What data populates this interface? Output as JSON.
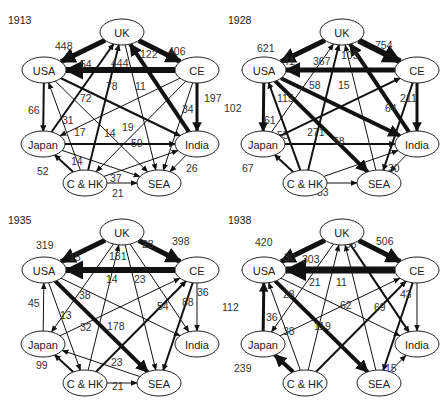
{
  "nodes": {
    "UK": {
      "label": "UK",
      "x": 122,
      "y": 32
    },
    "USA": {
      "label": "USA",
      "x": 44,
      "y": 70
    },
    "CE": {
      "label": "CE",
      "x": 197,
      "y": 70
    },
    "Japan": {
      "label": "Japan",
      "x": 43,
      "y": 144
    },
    "India": {
      "label": "India",
      "x": 197,
      "y": 144
    },
    "CHK": {
      "label": "C & HK",
      "x": 85,
      "y": 183
    },
    "SEA": {
      "label": "SEA",
      "x": 159,
      "y": 183
    }
  },
  "panels": [
    {
      "year": "1913",
      "ox": 0,
      "oy": 0,
      "edges": [
        {
          "from": "UK",
          "to": "USA",
          "value": "448",
          "w": 5,
          "lx": 55,
          "ly": 50
        },
        {
          "from": "UK",
          "to": "CE",
          "value": "406",
          "w": 5,
          "lx": 168,
          "ly": 55
        },
        {
          "from": "CE",
          "to": "USA",
          "value": "444",
          "w": 6,
          "lx": 111,
          "ly": 67
        },
        {
          "from": "India",
          "to": "UK",
          "value": "122",
          "w": 4,
          "lx": 140,
          "ly": 58
        },
        {
          "from": "CE",
          "to": "India",
          "value": "197",
          "w": 3,
          "lx": 204,
          "ly": 102
        },
        {
          "from": "Japan",
          "to": "UK",
          "value": "54",
          "w": 2,
          "lx": 80,
          "ly": 68
        },
        {
          "from": "CHK",
          "to": "UK",
          "value": "78",
          "w": 2,
          "lx": 106,
          "ly": 90
        },
        {
          "from": "UK",
          "to": "SEA",
          "value": "11",
          "w": 1,
          "lx": 135,
          "ly": 90
        },
        {
          "from": "USA",
          "to": "India",
          "value": "72",
          "w": 2,
          "lx": 80,
          "ly": 102
        },
        {
          "from": "CE",
          "to": "SEA",
          "value": "34",
          "w": 1,
          "lx": 182,
          "ly": 113
        },
        {
          "from": "USA",
          "to": "Japan",
          "value": "66",
          "w": 2,
          "lx": 28,
          "ly": 114
        },
        {
          "from": "CHK",
          "to": "USA",
          "value": "31",
          "w": 1,
          "lx": 62,
          "ly": 124
        },
        {
          "from": "CE",
          "to": "Japan",
          "value": "17",
          "w": 1,
          "lx": 74,
          "ly": 136
        },
        {
          "from": "USA",
          "to": "SEA",
          "value": "14",
          "w": 1,
          "lx": 104,
          "ly": 137
        },
        {
          "from": "CE",
          "to": "CHK",
          "value": "19",
          "w": 1,
          "lx": 122,
          "ly": 131
        },
        {
          "from": "Japan",
          "to": "India",
          "value": "59",
          "w": 2,
          "lx": 131,
          "ly": 147
        },
        {
          "from": "Japan",
          "to": "SEA",
          "value": "14",
          "w": 1,
          "lx": 71,
          "ly": 165
        },
        {
          "from": "CHK",
          "to": "Japan",
          "value": "52",
          "w": 2,
          "lx": 37,
          "ly": 175
        },
        {
          "from": "CHK",
          "to": "India",
          "value": "37",
          "w": 1,
          "lx": 110,
          "ly": 182
        },
        {
          "from": "CHK",
          "to": "SEA",
          "value": "21",
          "w": 1,
          "lx": 112,
          "ly": 197
        },
        {
          "from": "India",
          "to": "SEA",
          "value": "26",
          "w": 1,
          "lx": 186,
          "ly": 172
        }
      ]
    },
    {
      "year": "1928",
      "ox": 220,
      "oy": 0,
      "edges": [
        {
          "from": "UK",
          "to": "USA",
          "value": "621",
          "w": 5,
          "lx": 37,
          "ly": 52
        },
        {
          "from": "UK",
          "to": "CE",
          "value": "754",
          "w": 6,
          "lx": 155,
          "ly": 49
        },
        {
          "from": "CE",
          "to": "USA",
          "value": "367",
          "w": 5,
          "lx": 93,
          "ly": 65
        },
        {
          "from": "India",
          "to": "UK",
          "value": "105",
          "w": 4,
          "lx": 121,
          "ly": 59
        },
        {
          "from": "Japan",
          "to": "UK",
          "value": "41",
          "w": 1,
          "lx": 63,
          "ly": 65
        },
        {
          "from": "CHK",
          "to": "UK",
          "value": "58",
          "w": 2,
          "lx": 89,
          "ly": 89
        },
        {
          "from": "SEA",
          "to": "UK",
          "value": "15",
          "w": 1,
          "lx": 118,
          "ly": 89
        },
        {
          "from": "CE",
          "to": "India",
          "value": "211",
          "w": 3,
          "lx": 180,
          "ly": 102
        },
        {
          "from": "USA",
          "to": "Japan",
          "value": "102",
          "w": 3,
          "lx": 4,
          "ly": 112
        },
        {
          "from": "CHK",
          "to": "USA",
          "value": "115",
          "w": 2,
          "lx": 57,
          "ly": 102
        },
        {
          "from": "CE",
          "to": "SEA",
          "value": "64",
          "w": 2,
          "lx": 165,
          "ly": 112
        },
        {
          "from": "Japan",
          "to": "CE",
          "value": "61",
          "w": 2,
          "lx": 44,
          "ly": 124
        },
        {
          "from": "USA",
          "to": "India",
          "value": "55",
          "w": 4,
          "lx": 57,
          "ly": 139
        },
        {
          "from": "USA",
          "to": "SEA",
          "value": "271",
          "w": 4,
          "lx": 87,
          "ly": 136
        },
        {
          "from": "Japan",
          "to": "India",
          "value": "58",
          "w": 2,
          "lx": 113,
          "ly": 145
        },
        {
          "from": "CHK",
          "to": "Japan",
          "value": "67",
          "w": 2,
          "lx": 22,
          "ly": 172
        },
        {
          "from": "CHK",
          "to": "India",
          "value": "21",
          "w": 1,
          "lx": 94,
          "ly": 184
        },
        {
          "from": "CHK",
          "to": "SEA",
          "value": "33",
          "w": 1,
          "lx": 97,
          "ly": 196
        },
        {
          "from": "India",
          "to": "SEA",
          "value": "30",
          "w": 1,
          "lx": 168,
          "ly": 172
        }
      ]
    },
    {
      "year": "1935",
      "ox": 0,
      "oy": 200,
      "edges": [
        {
          "from": "UK",
          "to": "USA",
          "value": "319",
          "w": 5,
          "lx": 36,
          "ly": 49
        },
        {
          "from": "UK",
          "to": "CE",
          "value": "398",
          "w": 5,
          "lx": 172,
          "ly": 45
        },
        {
          "from": "CE",
          "to": "USA",
          "value": "181",
          "w": 6,
          "lx": 109,
          "ly": 60
        },
        {
          "from": "UK",
          "to": "Japan",
          "value": "15",
          "w": 1,
          "lx": 69,
          "ly": 61
        },
        {
          "from": "UK",
          "to": "India",
          "value": "28",
          "w": 1,
          "lx": 142,
          "ly": 48
        },
        {
          "from": "CHK",
          "to": "UK",
          "value": "14",
          "w": 1,
          "lx": 106,
          "ly": 83
        },
        {
          "from": "UK",
          "to": "SEA",
          "value": "23",
          "w": 1,
          "lx": 134,
          "ly": 83
        },
        {
          "from": "USA",
          "to": "CHK",
          "value": "13",
          "w": 1,
          "lx": 60,
          "ly": 119
        },
        {
          "from": "USA",
          "to": "India",
          "value": "38",
          "w": 1,
          "lx": 79,
          "ly": 99
        },
        {
          "from": "CE",
          "to": "India",
          "value": "36",
          "w": 1,
          "lx": 197,
          "ly": 96
        },
        {
          "from": "Japan",
          "to": "USA",
          "value": "45",
          "w": 1,
          "lx": 28,
          "ly": 107
        },
        {
          "from": "CHK",
          "to": "CE",
          "value": "54",
          "w": 2,
          "lx": 157,
          "ly": 110
        },
        {
          "from": "CE",
          "to": "SEA",
          "value": "88",
          "w": 2,
          "lx": 182,
          "ly": 106
        },
        {
          "from": "Japan",
          "to": "CE",
          "value": "32",
          "w": 1,
          "lx": 80,
          "ly": 131
        },
        {
          "from": "USA",
          "to": "SEA",
          "value": "178",
          "w": 4,
          "lx": 107,
          "ly": 130
        },
        {
          "from": "SEA",
          "to": "Japan",
          "value": "23",
          "w": 1,
          "lx": 111,
          "ly": 166
        },
        {
          "from": "CHK",
          "to": "Japan",
          "value": "99",
          "w": 2,
          "lx": 36,
          "ly": 169
        },
        {
          "from": "CHK",
          "to": "SEA",
          "value": "21",
          "w": 1,
          "lx": 112,
          "ly": 190
        }
      ]
    },
    {
      "year": "1938",
      "ox": 220,
      "oy": 200,
      "edges": [
        {
          "from": "UK",
          "to": "USA",
          "value": "420",
          "w": 5,
          "lx": 35,
          "ly": 46
        },
        {
          "from": "UK",
          "to": "CE",
          "value": "506",
          "w": 5,
          "lx": 156,
          "ly": 45
        },
        {
          "from": "CE",
          "to": "USA",
          "value": "303",
          "w": 7,
          "lx": 82,
          "ly": 63
        },
        {
          "from": "UK",
          "to": "Japan",
          "value": "30",
          "w": 1,
          "lx": 64,
          "ly": 61
        },
        {
          "from": "UK",
          "to": "India",
          "value": "96",
          "w": 2,
          "lx": 125,
          "ly": 48
        },
        {
          "from": "CHK",
          "to": "UK",
          "value": "21",
          "w": 1,
          "lx": 89,
          "ly": 86
        },
        {
          "from": "SEA",
          "to": "UK",
          "value": "11",
          "w": 1,
          "lx": 116,
          "ly": 86
        },
        {
          "from": "CE",
          "to": "India",
          "value": "43",
          "w": 1,
          "lx": 180,
          "ly": 98
        },
        {
          "from": "USA",
          "to": "India",
          "value": "28",
          "w": 1,
          "lx": 63,
          "ly": 98
        },
        {
          "from": "CHK",
          "to": "CE",
          "value": "62",
          "w": 2,
          "lx": 120,
          "ly": 109
        },
        {
          "from": "CE",
          "to": "SEA",
          "value": "69",
          "w": 2,
          "lx": 154,
          "ly": 111
        },
        {
          "from": "Japan",
          "to": "USA",
          "value": "112",
          "w": 3,
          "lx": 2,
          "ly": 111
        },
        {
          "from": "CHK",
          "to": "USA",
          "value": "36",
          "w": 1,
          "lx": 46,
          "ly": 121
        },
        {
          "from": "Japan",
          "to": "CE",
          "value": "38",
          "w": 1,
          "lx": 63,
          "ly": 135
        },
        {
          "from": "USA",
          "to": "SEA",
          "value": "119",
          "w": 4,
          "lx": 94,
          "ly": 130
        },
        {
          "from": "CHK",
          "to": "Japan",
          "value": "239",
          "w": 4,
          "lx": 14,
          "ly": 172
        },
        {
          "from": "SEA",
          "to": "India",
          "value": "15",
          "w": 1,
          "lx": 165,
          "ly": 172
        }
      ]
    }
  ],
  "chart_data": {
    "type": "network",
    "nodes": [
      "UK",
      "USA",
      "CE",
      "Japan",
      "India",
      "C & HK",
      "SEA"
    ],
    "panels": [
      {
        "year": "1913",
        "flows": [
          [
            "UK",
            "USA",
            448
          ],
          [
            "UK",
            "CE",
            406
          ],
          [
            "CE",
            "USA",
            444
          ],
          [
            "India",
            "UK",
            122
          ],
          [
            "CE",
            "India",
            197
          ],
          [
            "Japan",
            "UK",
            54
          ],
          [
            "C & HK",
            "UK",
            78
          ],
          [
            "UK",
            "SEA",
            11
          ],
          [
            "USA",
            "India",
            72
          ],
          [
            "CE",
            "SEA",
            34
          ],
          [
            "USA",
            "Japan",
            66
          ],
          [
            "C & HK",
            "USA",
            31
          ],
          [
            "CE",
            "Japan",
            17
          ],
          [
            "USA",
            "SEA",
            14
          ],
          [
            "CE",
            "C & HK",
            19
          ],
          [
            "Japan",
            "India",
            59
          ],
          [
            "Japan",
            "SEA",
            14
          ],
          [
            "C & HK",
            "Japan",
            52
          ],
          [
            "C & HK",
            "India",
            37
          ],
          [
            "C & HK",
            "SEA",
            21
          ],
          [
            "India",
            "SEA",
            26
          ]
        ]
      },
      {
        "year": "1928",
        "flows": [
          [
            "UK",
            "USA",
            621
          ],
          [
            "UK",
            "CE",
            754
          ],
          [
            "CE",
            "USA",
            367
          ],
          [
            "India",
            "UK",
            105
          ],
          [
            "Japan",
            "UK",
            41
          ],
          [
            "C & HK",
            "UK",
            58
          ],
          [
            "SEA",
            "UK",
            15
          ],
          [
            "CE",
            "India",
            211
          ],
          [
            "USA",
            "Japan",
            102
          ],
          [
            "C & HK",
            "USA",
            115
          ],
          [
            "CE",
            "SEA",
            64
          ],
          [
            "Japan",
            "CE",
            61
          ],
          [
            "USA",
            "India",
            55
          ],
          [
            "USA",
            "SEA",
            271
          ],
          [
            "Japan",
            "India",
            58
          ],
          [
            "C & HK",
            "Japan",
            67
          ],
          [
            "C & HK",
            "India",
            21
          ],
          [
            "C & HK",
            "SEA",
            33
          ],
          [
            "India",
            "SEA",
            30
          ]
        ]
      },
      {
        "year": "1935",
        "flows": [
          [
            "UK",
            "USA",
            319
          ],
          [
            "UK",
            "CE",
            398
          ],
          [
            "CE",
            "USA",
            181
          ],
          [
            "UK",
            "Japan",
            15
          ],
          [
            "UK",
            "India",
            28
          ],
          [
            "C & HK",
            "UK",
            14
          ],
          [
            "UK",
            "SEA",
            23
          ],
          [
            "USA",
            "C & HK",
            13
          ],
          [
            "USA",
            "India",
            38
          ],
          [
            "CE",
            "India",
            36
          ],
          [
            "Japan",
            "USA",
            45
          ],
          [
            "C & HK",
            "CE",
            54
          ],
          [
            "CE",
            "SEA",
            88
          ],
          [
            "Japan",
            "CE",
            32
          ],
          [
            "USA",
            "SEA",
            178
          ],
          [
            "SEA",
            "Japan",
            23
          ],
          [
            "C & HK",
            "Japan",
            99
          ],
          [
            "C & HK",
            "SEA",
            21
          ]
        ]
      },
      {
        "year": "1938",
        "flows": [
          [
            "UK",
            "USA",
            420
          ],
          [
            "UK",
            "CE",
            506
          ],
          [
            "CE",
            "USA",
            303
          ],
          [
            "UK",
            "Japan",
            30
          ],
          [
            "UK",
            "India",
            96
          ],
          [
            "C & HK",
            "UK",
            21
          ],
          [
            "SEA",
            "UK",
            11
          ],
          [
            "CE",
            "India",
            43
          ],
          [
            "USA",
            "India",
            28
          ],
          [
            "C & HK",
            "CE",
            62
          ],
          [
            "CE",
            "SEA",
            69
          ],
          [
            "Japan",
            "USA",
            112
          ],
          [
            "C & HK",
            "USA",
            36
          ],
          [
            "Japan",
            "CE",
            38
          ],
          [
            "USA",
            "SEA",
            119
          ],
          [
            "C & HK",
            "Japan",
            239
          ],
          [
            "SEA",
            "India",
            15
          ]
        ]
      }
    ]
  }
}
